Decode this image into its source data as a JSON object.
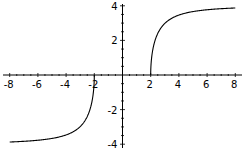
{
  "chart_data": {
    "type": "line",
    "title": "",
    "xlabel": "",
    "ylabel": "",
    "xlim": [
      -8.5,
      8.5
    ],
    "ylim": [
      -4,
      4
    ],
    "grid": false,
    "legend": null,
    "x_ticks": [
      -8,
      -6,
      -4,
      -2,
      2,
      4,
      6,
      8
    ],
    "x_tick_labels": [
      "-8",
      "-6",
      "-4",
      "-2",
      "2",
      "4",
      "6",
      "8"
    ],
    "y_ticks": [
      -4,
      -2,
      2,
      4
    ],
    "y_tick_labels": [
      "-4",
      "-2",
      "2",
      "4"
    ],
    "series": [
      {
        "name": "right branch",
        "x": [
          2,
          2.05,
          2.2,
          2.5,
          3,
          3.5,
          4,
          5,
          6,
          7,
          8
        ],
        "y": [
          0,
          0.88,
          1.67,
          2.4,
          2.98,
          3.28,
          3.46,
          3.67,
          3.77,
          3.83,
          3.87
        ]
      },
      {
        "name": "left branch",
        "x": [
          -8,
          -7,
          -6,
          -5,
          -4,
          -3.5,
          -3,
          -2.5,
          -2.2,
          -2.05,
          -2
        ],
        "y": [
          -3.87,
          -3.83,
          -3.77,
          -3.67,
          -3.46,
          -3.28,
          -2.98,
          -2.4,
          -1.67,
          -0.88,
          0
        ]
      }
    ],
    "color": "#000000"
  }
}
